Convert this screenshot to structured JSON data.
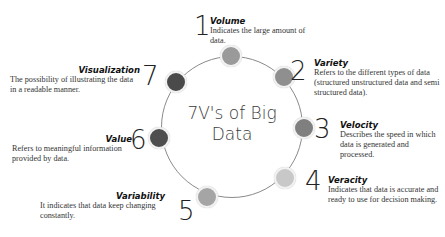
{
  "diagram": {
    "center_title": "7V's of Big Data",
    "center_line1": "7V's of Big",
    "center_line2": "Data",
    "items": [
      {
        "number": "1",
        "title": "Volume",
        "description": "Indicates the large amount of data.",
        "color": "#9a9a9a"
      },
      {
        "number": "2",
        "title": "Variety",
        "description": "Refers to the different types of data (structured unstructured data and semi structured data).",
        "color": "#8f8f8f"
      },
      {
        "number": "3",
        "title": "Velocity",
        "description": "Describes the speed in which data is generated and processed.",
        "color": "#7f7f7f"
      },
      {
        "number": "4",
        "title": "Veracity",
        "description": "Indicates that data is accurate and ready to use for decision making.",
        "color": "#c8c8c8"
      },
      {
        "number": "5",
        "title": "Variability",
        "description": "It indicates that data keep changing constantly.",
        "color": "#a5a5a5"
      },
      {
        "number": "6",
        "title": "Value",
        "description": "Refers to meaningful information provided by data.",
        "color": "#4e4e4e"
      },
      {
        "number": "7",
        "title": "Visualization",
        "description": "The possibility of illustrating the data in a readable manner.",
        "color": "#4a4a4a"
      }
    ]
  }
}
